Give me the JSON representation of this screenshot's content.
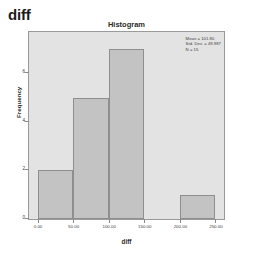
{
  "output": {
    "header": "diff"
  },
  "chart_data": {
    "type": "bar",
    "title": "Histogram",
    "xlabel": "diff",
    "ylabel": "Frequency",
    "bin_width": 50,
    "xlim": [
      -12,
      262
    ],
    "ylim": [
      0,
      7.7
    ],
    "grid": false,
    "legend": null,
    "categories": [
      "0-50",
      "50-100",
      "100-150",
      "150-200",
      "200-250"
    ],
    "bins": [
      {
        "start": 0,
        "end": 50,
        "value": 2
      },
      {
        "start": 50,
        "end": 100,
        "value": 5
      },
      {
        "start": 100,
        "end": 150,
        "value": 7
      },
      {
        "start": 150,
        "end": 200,
        "value": 0
      },
      {
        "start": 200,
        "end": 250,
        "value": 1
      }
    ],
    "values": [
      2,
      5,
      7,
      0,
      1
    ],
    "xticks": [
      {
        "value": 0,
        "label": "0.00"
      },
      {
        "value": 50,
        "label": "50.00"
      },
      {
        "value": 100,
        "label": "100.00"
      },
      {
        "value": 150,
        "label": "150.00"
      },
      {
        "value": 200,
        "label": "200.00"
      },
      {
        "value": 250,
        "label": "250.00"
      }
    ],
    "yticks": [
      {
        "value": 0,
        "label": "0"
      },
      {
        "value": 2,
        "label": "2"
      },
      {
        "value": 4,
        "label": "4"
      },
      {
        "value": 6,
        "label": "6"
      }
    ],
    "annotations": {
      "mean": "Mean = 101.80",
      "std_dev": "Std. Dev. = 49.987",
      "n": "N = 15"
    },
    "colors": {
      "bar_fill": "#c3c3c3",
      "bar_border": "#8e8e8e",
      "plot_background": "#e3e3e3",
      "frame_border": "#9a9a9a"
    }
  }
}
